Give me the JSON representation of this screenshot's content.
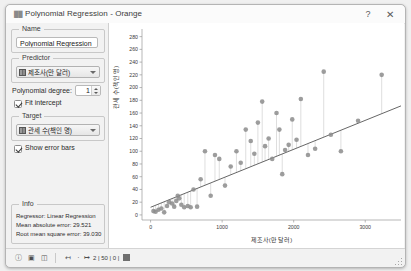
{
  "window": {
    "title": "Polynomial Regression - Orange",
    "icon": "orange-widget-icon",
    "help_label": "?",
    "close_label": "✕"
  },
  "controls": {
    "name_box_label": "Name",
    "name_value": "Polynomial Regression",
    "predictor_box_label": "Predictor",
    "predictor_value": "제조사(만 달러)",
    "degree_label": "Polynomial degree:",
    "degree_value": "1",
    "fit_intercept_label": "Fit intercept",
    "fit_intercept_checked": true,
    "target_box_label": "Target",
    "target_value": "관세 수(책인 명)",
    "show_error_bars_label": "Show error bars",
    "show_error_bars_checked": true
  },
  "info": {
    "box_label": "Info",
    "regressor": "Regressor: Linear Regression",
    "mae": "Mean absolute error: 29.521",
    "rmse": "Root mean square error: 39.030"
  },
  "statusbar": {
    "icons": [
      "info-icon",
      "image-icon",
      "copy-icon",
      "input-icon",
      "output-icon"
    ],
    "counts": "2 | 50 | 0 |"
  },
  "chart_data": {
    "type": "scatter",
    "title": "",
    "xlabel": "제조사(만 달러)",
    "ylabel": "관세 수(책인 명)",
    "xlim": [
      -120,
      3500
    ],
    "ylim": [
      -8,
      292
    ],
    "xticks": [
      0,
      1000,
      2000,
      3000
    ],
    "yticks": [
      0,
      20,
      40,
      60,
      80,
      100,
      120,
      140,
      160,
      180,
      200,
      220,
      240,
      260,
      280
    ],
    "grid": false,
    "legend": null,
    "marker_color": "#8c8c8c",
    "line_color": "#555555",
    "error_bar_color": "#c8c8c8",
    "regression_line": {
      "intercept": 12,
      "slope": 0.0455
    },
    "points": [
      {
        "x": 40,
        "y": 6,
        "fit": 14
      },
      {
        "x": 70,
        "y": 5,
        "fit": 15
      },
      {
        "x": 110,
        "y": 8,
        "fit": 17
      },
      {
        "x": 150,
        "y": 10,
        "fit": 19
      },
      {
        "x": 190,
        "y": 4,
        "fit": 21
      },
      {
        "x": 230,
        "y": 14,
        "fit": 22
      },
      {
        "x": 260,
        "y": 20,
        "fit": 24
      },
      {
        "x": 300,
        "y": 18,
        "fit": 26
      },
      {
        "x": 330,
        "y": 13,
        "fit": 27
      },
      {
        "x": 360,
        "y": 22,
        "fit": 28
      },
      {
        "x": 380,
        "y": 30,
        "fit": 29
      },
      {
        "x": 400,
        "y": 26,
        "fit": 30
      },
      {
        "x": 430,
        "y": 16,
        "fit": 32
      },
      {
        "x": 470,
        "y": 12,
        "fit": 33
      },
      {
        "x": 520,
        "y": 14,
        "fit": 36
      },
      {
        "x": 560,
        "y": 12,
        "fit": 38
      },
      {
        "x": 600,
        "y": 40,
        "fit": 39
      },
      {
        "x": 650,
        "y": 13,
        "fit": 42
      },
      {
        "x": 700,
        "y": 56,
        "fit": 44
      },
      {
        "x": 760,
        "y": 100,
        "fit": 47
      },
      {
        "x": 840,
        "y": 30,
        "fit": 50
      },
      {
        "x": 900,
        "y": 94,
        "fit": 53
      },
      {
        "x": 960,
        "y": 88,
        "fit": 56
      },
      {
        "x": 1040,
        "y": 46,
        "fit": 59
      },
      {
        "x": 1120,
        "y": 76,
        "fit": 63
      },
      {
        "x": 1200,
        "y": 100,
        "fit": 67
      },
      {
        "x": 1260,
        "y": 82,
        "fit": 69
      },
      {
        "x": 1330,
        "y": 134,
        "fit": 73
      },
      {
        "x": 1400,
        "y": 116,
        "fit": 76
      },
      {
        "x": 1450,
        "y": 96,
        "fit": 78
      },
      {
        "x": 1500,
        "y": 145,
        "fit": 80
      },
      {
        "x": 1560,
        "y": 178,
        "fit": 83
      },
      {
        "x": 1600,
        "y": 108,
        "fit": 85
      },
      {
        "x": 1650,
        "y": 120,
        "fit": 87
      },
      {
        "x": 1700,
        "y": 88,
        "fit": 89
      },
      {
        "x": 1760,
        "y": 160,
        "fit": 92
      },
      {
        "x": 1800,
        "y": 134,
        "fit": 94
      },
      {
        "x": 1840,
        "y": 64,
        "fit": 96
      },
      {
        "x": 1880,
        "y": 102,
        "fit": 98
      },
      {
        "x": 1930,
        "y": 110,
        "fit": 100
      },
      {
        "x": 1980,
        "y": 150,
        "fit": 102
      },
      {
        "x": 2040,
        "y": 118,
        "fit": 105
      },
      {
        "x": 2100,
        "y": 182,
        "fit": 108
      },
      {
        "x": 2200,
        "y": 94,
        "fit": 112
      },
      {
        "x": 2300,
        "y": 104,
        "fit": 117
      },
      {
        "x": 2420,
        "y": 225,
        "fit": 122
      },
      {
        "x": 2520,
        "y": 126,
        "fit": 127
      },
      {
        "x": 2660,
        "y": 100,
        "fit": 133
      },
      {
        "x": 2900,
        "y": 148,
        "fit": 144
      },
      {
        "x": 3230,
        "y": 220,
        "fit": 159
      }
    ]
  }
}
